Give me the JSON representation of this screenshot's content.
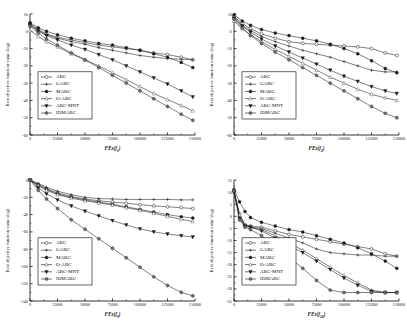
{
  "figure": {
    "name": "convergence-curves-figure",
    "panel_count": 4,
    "shared_ylabel": "Best objective function value (log)",
    "legend_entries": [
      {
        "label": "ABC",
        "marker": "open-circle"
      },
      {
        "label": "GABC",
        "marker": "line-plus"
      },
      {
        "label": "MABC",
        "marker": "filled-circle"
      },
      {
        "label": "O-ABC",
        "marker": "open-triangle-up"
      },
      {
        "label": "ABC-MNT",
        "marker": "filled-triangle-down"
      },
      {
        "label": "IDMABC",
        "marker": "filled-hexagon"
      }
    ],
    "colors": {
      "ink": "#1a1a1a",
      "grey": "#6f6f6f",
      "paper": "#ffffff"
    }
  },
  "chart_data": [
    {
      "id": "panel-f1",
      "type": "line",
      "title": "",
      "xlabel": "FEs(f1)",
      "ylabel": "Best objective function value (log)",
      "xlim": [
        0,
        150000
      ],
      "ylim": [
        -60,
        10
      ],
      "xticks": [
        0,
        25000,
        50000,
        75000,
        100000,
        125000,
        150000
      ],
      "yticks": [
        10,
        0,
        -10,
        -20,
        -30,
        -40,
        -50,
        -60
      ],
      "grid": false,
      "legend_position": "lower-left",
      "x": [
        0,
        7500,
        15000,
        25000,
        37500,
        50000,
        62500,
        75000,
        87500,
        100000,
        112500,
        125000,
        137500,
        148000
      ],
      "series": [
        {
          "name": "ABC",
          "marker": "open-circle",
          "values": [
            4.5,
            1.0,
            -1.5,
            -3.5,
            -5.0,
            -6.5,
            -8.0,
            -9.0,
            -10.0,
            -11.0,
            -12.5,
            -13.5,
            -15.0,
            -16.5
          ]
        },
        {
          "name": "GABC",
          "marker": "line-plus",
          "values": [
            4.0,
            0.5,
            -2.0,
            -4.0,
            -6.0,
            -7.5,
            -9.5,
            -11.0,
            -12.5,
            -14.0,
            -15.0,
            -15.8,
            -16.2,
            -16.5
          ]
        },
        {
          "name": "MABC",
          "marker": "filled-circle",
          "values": [
            5.0,
            2.0,
            0.0,
            -2.0,
            -4.0,
            -5.5,
            -7.0,
            -8.0,
            -9.5,
            -11.0,
            -13.0,
            -15.0,
            -18.0,
            -21.0
          ]
        },
        {
          "name": "O-ABC",
          "marker": "open-triangle-up",
          "values": [
            0.5,
            -3.0,
            -6.0,
            -9.0,
            -13.0,
            -16.5,
            -20.0,
            -24.0,
            -28.0,
            -32.0,
            -36.0,
            -39.5,
            -43.0,
            -46.0
          ]
        },
        {
          "name": "ABC-MNT",
          "marker": "filled-triangle-down",
          "values": [
            3.5,
            0.0,
            -2.5,
            -5.0,
            -8.0,
            -10.5,
            -13.5,
            -16.5,
            -20.0,
            -23.5,
            -27.0,
            -30.5,
            -34.5,
            -38.0
          ]
        },
        {
          "name": "IDMABC",
          "marker": "filled-hexagon",
          "values": [
            3.0,
            -1.0,
            -4.5,
            -8.0,
            -12.5,
            -16.5,
            -21.0,
            -25.5,
            -30.0,
            -34.5,
            -39.0,
            -43.5,
            -48.0,
            -51.5
          ]
        }
      ]
    },
    {
      "id": "panel-f2",
      "type": "line",
      "title": "",
      "xlabel": "FEs(f2)",
      "ylabel": "Best objective function value (log)",
      "xlim": [
        0,
        150000
      ],
      "ylim": [
        -60,
        10
      ],
      "xticks": [
        0,
        25000,
        50000,
        75000,
        100000,
        125000,
        150000
      ],
      "yticks": [
        10,
        0,
        -10,
        -20,
        -30,
        -40,
        -50,
        -60
      ],
      "grid": false,
      "legend_position": "lower-left",
      "x": [
        0,
        7500,
        15000,
        25000,
        37500,
        50000,
        62500,
        75000,
        87500,
        100000,
        112500,
        125000,
        137500,
        148000
      ],
      "series": [
        {
          "name": "ABC",
          "marker": "open-circle",
          "values": [
            8.5,
            4.5,
            1.5,
            -1.5,
            -4.0,
            -6.0,
            -7.0,
            -7.5,
            -8.0,
            -8.5,
            -9.0,
            -10.0,
            -12.5,
            -14.0
          ]
        },
        {
          "name": "GABC",
          "marker": "line-plus",
          "values": [
            8.0,
            3.5,
            0.5,
            -3.0,
            -6.0,
            -8.5,
            -11.0,
            -13.0,
            -15.0,
            -17.5,
            -20.0,
            -22.5,
            -23.5,
            -23.5
          ]
        },
        {
          "name": "MABC",
          "marker": "filled-circle",
          "values": [
            9.5,
            6.0,
            3.5,
            1.0,
            -1.0,
            -2.5,
            -4.0,
            -5.5,
            -7.5,
            -10.0,
            -13.0,
            -17.0,
            -21.5,
            -24.0
          ]
        },
        {
          "name": "O-ABC",
          "marker": "open-triangle-up",
          "values": [
            6.0,
            1.5,
            -2.0,
            -6.0,
            -10.5,
            -14.5,
            -18.5,
            -22.5,
            -26.5,
            -30.0,
            -33.5,
            -36.5,
            -38.5,
            -40.0
          ]
        },
        {
          "name": "ABC-MNT",
          "marker": "filled-triangle-down",
          "values": [
            7.5,
            3.0,
            -0.5,
            -4.5,
            -8.5,
            -12.0,
            -15.5,
            -19.0,
            -22.5,
            -26.0,
            -29.0,
            -32.0,
            -34.5,
            -36.0
          ]
        },
        {
          "name": "IDMABC",
          "marker": "filled-hexagon",
          "values": [
            7.0,
            2.0,
            -2.5,
            -7.0,
            -12.0,
            -16.5,
            -21.0,
            -25.5,
            -30.0,
            -34.5,
            -39.0,
            -43.5,
            -47.5,
            -50.0
          ]
        }
      ]
    },
    {
      "id": "panel-f9",
      "type": "line",
      "title": "",
      "xlabel": "FEs(f9)",
      "ylabel": "Best objective function value (log)",
      "xlim": [
        0,
        150000
      ],
      "ylim": [
        -140,
        0
      ],
      "xticks": [
        0,
        25000,
        50000,
        75000,
        100000,
        125000,
        150000
      ],
      "yticks": [
        0,
        -20,
        -40,
        -60,
        -80,
        -100,
        -120,
        -140
      ],
      "grid": false,
      "legend_position": "lower-left",
      "x": [
        0,
        7500,
        15000,
        25000,
        37500,
        50000,
        62500,
        75000,
        87500,
        100000,
        112500,
        125000,
        137500,
        148000
      ],
      "series": [
        {
          "name": "ABC",
          "marker": "open-circle",
          "values": [
            0.0,
            -5.0,
            -10.0,
            -15.0,
            -19.0,
            -22.0,
            -24.0,
            -25.5,
            -27.0,
            -28.5,
            -30.0,
            -31.0,
            -32.0,
            -33.0
          ]
        },
        {
          "name": "GABC",
          "marker": "line-plus",
          "values": [
            0.0,
            -4.0,
            -8.5,
            -13.0,
            -17.0,
            -20.0,
            -21.5,
            -22.0,
            -22.5,
            -22.5,
            -22.5,
            -22.5,
            -23.0,
            -23.0
          ]
        },
        {
          "name": "MABC",
          "marker": "filled-circle",
          "values": [
            0.0,
            -6.0,
            -11.0,
            -16.0,
            -20.0,
            -23.0,
            -25.5,
            -28.0,
            -31.0,
            -34.0,
            -37.0,
            -40.0,
            -42.5,
            -44.0
          ]
        },
        {
          "name": "O-ABC",
          "marker": "open-triangle-up",
          "values": [
            0.0,
            -6.5,
            -12.0,
            -17.0,
            -21.0,
            -24.0,
            -26.5,
            -29.0,
            -32.0,
            -35.0,
            -38.5,
            -42.0,
            -45.5,
            -48.0
          ]
        },
        {
          "name": "ABC-MNT",
          "marker": "filled-triangle-down",
          "values": [
            0.0,
            -9.0,
            -16.0,
            -23.0,
            -30.0,
            -36.0,
            -41.5,
            -47.0,
            -52.0,
            -56.5,
            -60.0,
            -62.5,
            -64.5,
            -66.0
          ]
        },
        {
          "name": "IDMABC",
          "marker": "filled-hexagon",
          "values": [
            0.0,
            -12.0,
            -22.0,
            -33.0,
            -46.0,
            -57.0,
            -68.0,
            -79.0,
            -90.0,
            -101.0,
            -112.0,
            -122.0,
            -130.0,
            -134.0
          ]
        }
      ]
    },
    {
      "id": "panel-f14",
      "type": "line",
      "title": "",
      "xlabel": "FEs(f14)",
      "ylabel": "Best objective function value (log)",
      "xlim": [
        0,
        150000
      ],
      "ylim": [
        -35,
        15
      ],
      "xticks": [
        0,
        25000,
        50000,
        75000,
        100000,
        125000,
        150000
      ],
      "yticks": [
        15,
        10,
        5,
        0,
        -5,
        -10,
        -15,
        -20,
        -25,
        -30,
        -35
      ],
      "grid": false,
      "legend_position": "lower-left",
      "x": [
        0,
        5000,
        10000,
        15000,
        25000,
        37500,
        50000,
        62500,
        75000,
        87500,
        100000,
        112500,
        125000,
        137500,
        148000
      ],
      "series": [
        {
          "name": "ABC",
          "marker": "open-circle",
          "values": [
            10.5,
            1.0,
            -3.5,
            -4.0,
            -4.5,
            -6.0,
            -7.5,
            -8.5,
            -9.5,
            -10.5,
            -11.5,
            -12.5,
            -13.5,
            -15.5,
            -16.5
          ]
        },
        {
          "name": "GABC",
          "marker": "line-plus",
          "values": [
            10.5,
            0.0,
            -4.0,
            -4.5,
            -5.0,
            -7.0,
            -9.0,
            -11.0,
            -13.5,
            -15.0,
            -15.5,
            -16.0,
            -16.0,
            -16.5,
            -16.5
          ]
        },
        {
          "name": "MABC",
          "marker": "filled-circle",
          "values": [
            11.0,
            6.0,
            2.0,
            -0.5,
            -2.5,
            -4.0,
            -5.5,
            -6.5,
            -8.0,
            -9.5,
            -11.0,
            -13.0,
            -15.5,
            -18.5,
            -21.5
          ]
        },
        {
          "name": "O-ABC",
          "marker": "open-triangle-up",
          "values": [
            10.0,
            0.5,
            -3.5,
            -4.5,
            -5.5,
            -8.0,
            -11.0,
            -14.0,
            -17.5,
            -21.0,
            -24.5,
            -27.5,
            -30.5,
            -31.5,
            -31.5
          ]
        },
        {
          "name": "ABC-MNT",
          "marker": "filled-triangle-down",
          "values": [
            10.0,
            -1.0,
            -4.0,
            -4.5,
            -6.0,
            -9.0,
            -12.0,
            -15.0,
            -18.5,
            -22.0,
            -25.5,
            -28.5,
            -31.0,
            -31.5,
            -31.5
          ]
        },
        {
          "name": "IDMABC",
          "marker": "filled-hexagon",
          "values": [
            10.5,
            -1.5,
            -4.5,
            -5.5,
            -8.0,
            -12.5,
            -17.0,
            -21.5,
            -26.5,
            -30.5,
            -31.5,
            -31.5,
            -31.5,
            -31.5,
            -31.5
          ]
        }
      ]
    }
  ]
}
